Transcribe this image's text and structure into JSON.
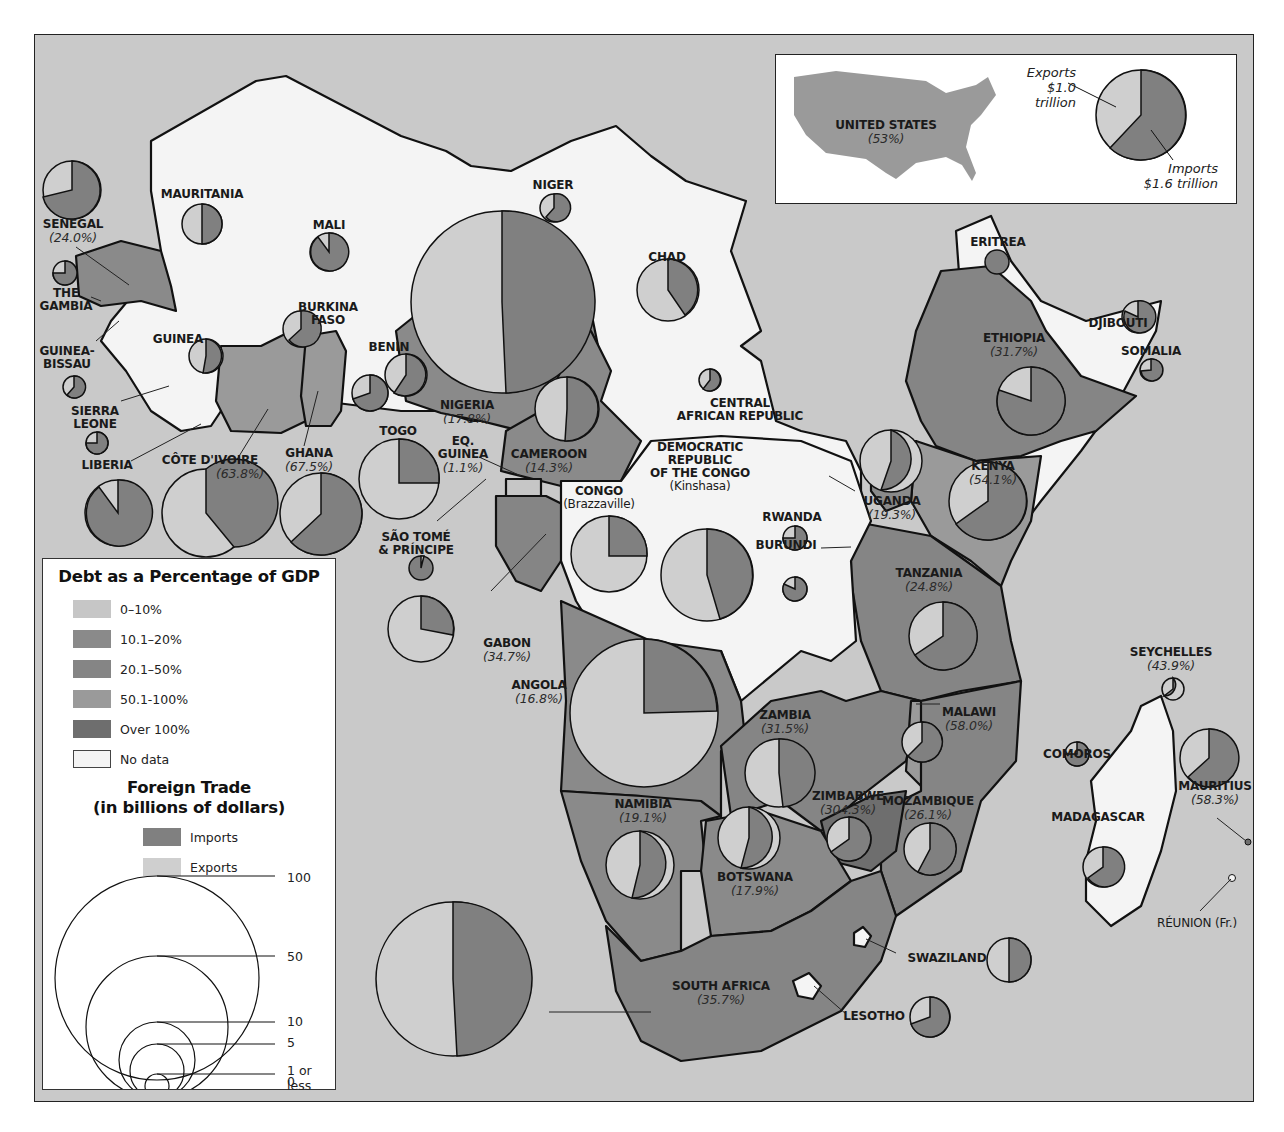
{
  "map": {
    "colors": {
      "ocean": "#c9c9c9",
      "no_data": "#f4f4f4",
      "debt_0_10": "#c6c6c6",
      "debt_10_20": "#8a8a8a",
      "debt_20_50": "#858585",
      "debt_50_100": "#9a9a9a",
      "debt_over_100": "#6e6e6e",
      "imports": "#808080",
      "exports": "#cfcfcf",
      "border": "#111111"
    },
    "legend": {
      "debt_title": "Debt as a Percentage of GDP",
      "debt_classes": [
        {
          "label": "0–10%",
          "color": "#c6c6c6"
        },
        {
          "label": "10.1–20%",
          "color": "#8a8a8a"
        },
        {
          "label": "20.1–50%",
          "color": "#858585"
        },
        {
          "label": "50.1-100%",
          "color": "#9a9a9a"
        },
        {
          "label": "Over 100%",
          "color": "#6e6e6e"
        },
        {
          "label": "No data",
          "color": "#f4f4f4"
        }
      ],
      "trade_title_line1": "Foreign Trade",
      "trade_title_line2": "(in billions of dollars)",
      "trade_keys": [
        {
          "label": "Imports",
          "color": "#808080"
        },
        {
          "label": "Exports",
          "color": "#cfcfcf"
        }
      ],
      "size_scale": [
        "100",
        "50",
        "10",
        "5",
        "1 or less",
        "0"
      ]
    },
    "inset": {
      "country": "UNITED STATES",
      "debt": "(53%)",
      "exports_label": "Exports",
      "exports_value": "$1.0 trillion",
      "imports_label": "Imports",
      "imports_value": "$1.6 trillion"
    },
    "countries": [
      {
        "name": "MAURITANIA",
        "debt": null
      },
      {
        "name": "SENEGAL",
        "debt": "(24.0%)"
      },
      {
        "name": "MALI",
        "debt": null
      },
      {
        "name": "NIGER",
        "debt": null
      },
      {
        "name": "CHAD",
        "debt": null
      },
      {
        "name": "ERITREA",
        "debt": null
      },
      {
        "name": "THE",
        "debt": null
      },
      {
        "name": "GAMBIA",
        "debt": null
      },
      {
        "name": "BURKINA",
        "debt": null
      },
      {
        "name": "FASO",
        "debt": null
      },
      {
        "name": "DJIBOUTI",
        "debt": null
      },
      {
        "name": "GUINEA-",
        "debt": null
      },
      {
        "name": "BISSAU",
        "debt": null
      },
      {
        "name": "GUINEA",
        "debt": null
      },
      {
        "name": "BENIN",
        "debt": null
      },
      {
        "name": "ETHIOPIA",
        "debt": "(31.7%)"
      },
      {
        "name": "SOMALIA",
        "debt": null
      },
      {
        "name": "SIERRA",
        "debt": null
      },
      {
        "name": "LEONE",
        "debt": null
      },
      {
        "name": "NIGERIA",
        "debt": "(17.8%)"
      },
      {
        "name": "CENTRAL",
        "debt": null
      },
      {
        "name": "AFRICAN REPUBLIC",
        "debt": null
      },
      {
        "name": "TOGO",
        "debt": null
      },
      {
        "name": "EQ.",
        "debt": null
      },
      {
        "name": "GUINEA",
        "debt": "(1.1%)"
      },
      {
        "name": "CAMEROON",
        "debt": "(14.3%)"
      },
      {
        "name": "LIBERIA",
        "debt": null
      },
      {
        "name": "CÔTE D'IVOIRE",
        "debt": "(63.8%)"
      },
      {
        "name": "GHANA",
        "debt": "(67.5%)"
      },
      {
        "name": "KENYA",
        "debt": "(54.1%)"
      },
      {
        "name": "DEMOCRATIC",
        "debt": null
      },
      {
        "name": "REPUBLIC",
        "debt": null
      },
      {
        "name": "OF THE CONGO",
        "debt": null
      },
      {
        "name": "(Kinshasa)",
        "debt": null
      },
      {
        "name": "CONGO",
        "debt": null
      },
      {
        "name": "(Brazzaville)",
        "debt": null
      },
      {
        "name": "UGANDA",
        "debt": "(19.3%)"
      },
      {
        "name": "RWANDA",
        "debt": null
      },
      {
        "name": "SÃO TOMÉ",
        "debt": null
      },
      {
        "name": "& PRÍNCIPE",
        "debt": null
      },
      {
        "name": "BURUNDI",
        "debt": null
      },
      {
        "name": "TANZANIA",
        "debt": "(24.8%)"
      },
      {
        "name": "GABON",
        "debt": "(34.7%)"
      },
      {
        "name": "SEYCHELLES",
        "debt": "(43.9%)"
      },
      {
        "name": "ANGOLA",
        "debt": "(16.8%)"
      },
      {
        "name": "ZAMBIA",
        "debt": "(31.5%)"
      },
      {
        "name": "MALAWI",
        "debt": "(58.0%)"
      },
      {
        "name": "COMOROS",
        "debt": null
      },
      {
        "name": "MAURITIUS",
        "debt": "(58.3%)"
      },
      {
        "name": "ZIMBABWE",
        "debt": "(304.3%)"
      },
      {
        "name": "MOZAMBIQUE",
        "debt": "(26.1%)"
      },
      {
        "name": "NAMIBIA",
        "debt": "(19.1%)"
      },
      {
        "name": "MADAGASCAR",
        "debt": null
      },
      {
        "name": "BOTSWANA",
        "debt": "(17.9%)"
      },
      {
        "name": "RÉUNION (Fr.)",
        "debt": null
      },
      {
        "name": "SWAZILAND",
        "debt": null
      },
      {
        "name": "SOUTH AFRICA",
        "debt": "(35.7%)"
      },
      {
        "name": "LESOTHO",
        "debt": null
      }
    ]
  }
}
